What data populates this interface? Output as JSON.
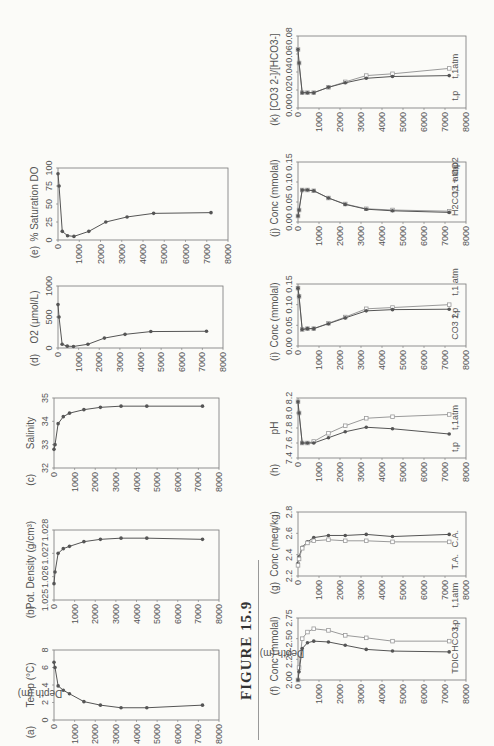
{
  "figure": {
    "label": "FIGURE 15.9",
    "y_axis_label": "Depth (m)"
  },
  "depth_ticks": [
    0,
    1000,
    2000,
    3000,
    4000,
    5000,
    6000,
    7000,
    8000
  ],
  "depths": [
    0,
    50,
    200,
    450,
    750,
    1450,
    2250,
    3250,
    4500,
    7200
  ],
  "chart_data": [
    {
      "id": "a",
      "type": "line",
      "title": "Temp (°C)",
      "xlabel": "Temp (°C)",
      "ylabel": "Depth (m)",
      "xlim": [
        0,
        8
      ],
      "xticks": [
        "0",
        "2",
        "4",
        "6",
        "8"
      ],
      "series": [
        {
          "name": "Temp",
          "y": [
            0,
            50,
            200,
            450,
            750,
            1450,
            2250,
            3250,
            4500,
            7200
          ],
          "x": [
            6.6,
            6.0,
            3.9,
            3.4,
            3.0,
            2.1,
            1.7,
            1.4,
            1.4,
            1.7
          ]
        }
      ]
    },
    {
      "id": "b",
      "type": "line",
      "title": "Pot. Density (g/cm³)",
      "xlabel": "(b) Pot. Density (g/cm3)",
      "ylabel": "Depth (m)",
      "xlim": [
        1.025,
        1.028
      ],
      "xticks": [
        "1.025",
        "1.026",
        "1.027",
        "1.028"
      ],
      "series": [
        {
          "name": "Potential density",
          "y": [
            0,
            50,
            200,
            450,
            750,
            1450,
            2250,
            3250,
            4500,
            7200
          ],
          "x": [
            1.0257,
            1.0262,
            1.027,
            1.0272,
            1.0273,
            1.0275,
            1.0276,
            1.02765,
            1.02765,
            1.0276
          ]
        }
      ]
    },
    {
      "id": "c",
      "type": "line",
      "title": "Salinity",
      "xlabel": "Salinity",
      "ylabel": "Depth (m)",
      "xlim": [
        32,
        35
      ],
      "xticks": [
        "32",
        "33",
        "34",
        "35"
      ],
      "series": [
        {
          "name": "Salinity",
          "y": [
            0,
            50,
            200,
            450,
            750,
            1450,
            2250,
            3250,
            4500,
            7200
          ],
          "x": [
            32.8,
            33.0,
            33.9,
            34.2,
            34.35,
            34.5,
            34.6,
            34.65,
            34.65,
            34.65
          ]
        }
      ]
    },
    {
      "id": "d",
      "type": "line",
      "title": "O2 (µmol/L)",
      "xlabel": "O2 (µmol/L)",
      "ylabel": "Depth (m)",
      "xlim": [
        0,
        1000
      ],
      "xticks": [
        "0",
        "500",
        "1000"
      ],
      "series": [
        {
          "name": "O2",
          "y": [
            0,
            50,
            200,
            450,
            750,
            1450,
            2250,
            3250,
            4500,
            7200
          ],
          "x": [
            700,
            500,
            60,
            30,
            25,
            60,
            160,
            220,
            265,
            270
          ]
        }
      ]
    },
    {
      "id": "e",
      "type": "line",
      "title": "% Saturation DO",
      "xlabel": "% Saturation DO",
      "ylabel": "Depth (m)",
      "xlim": [
        0,
        100
      ],
      "xticks": [
        "0",
        "25",
        "50",
        "75",
        "100"
      ],
      "series": [
        {
          "name": "% Saturation DO",
          "y": [
            0,
            50,
            200,
            450,
            750,
            1450,
            2250,
            3250,
            4500,
            7200
          ],
          "x": [
            92,
            75,
            12,
            6,
            5,
            12,
            25,
            32,
            37,
            38
          ]
        }
      ]
    },
    {
      "id": "f",
      "type": "line",
      "title": "Conc (mmolal)",
      "xlabel": "Conc (mmolal)",
      "ylabel": "Depth (m)",
      "xlim": [
        2.0,
        2.75
      ],
      "xticks": [
        "2.00",
        "2.25",
        "2.50",
        "2.75"
      ],
      "series": [
        {
          "name": "TDIC",
          "marker": "square",
          "y": [
            0,
            50,
            200,
            450,
            750,
            1450,
            2250,
            3250,
            4500,
            7200
          ],
          "x": [
            2.0,
            2.15,
            2.5,
            2.58,
            2.62,
            2.6,
            2.54,
            2.51,
            2.47,
            2.47
          ]
        },
        {
          "name": "HCO3-",
          "marker": "diamond",
          "y": [
            0,
            50,
            200,
            450,
            750,
            1450,
            2250,
            3250,
            4500,
            7200
          ],
          "x": [
            2.0,
            2.1,
            2.38,
            2.45,
            2.47,
            2.46,
            2.42,
            2.37,
            2.35,
            2.34
          ]
        }
      ],
      "annotations": [
        "TDIC",
        "HCO3-",
        "t,p",
        "t,1atm"
      ]
    },
    {
      "id": "g",
      "type": "line",
      "title": "Conc (meq/kg)",
      "xlabel": "Conc (meq/kg)",
      "ylabel": "Depth (m)",
      "xlim": [
        2.2,
        2.8
      ],
      "xticks": [
        "2.2",
        "2.4",
        "2.6",
        "2.8"
      ],
      "series": [
        {
          "name": "T.A.",
          "marker": "diamond",
          "y": [
            0,
            50,
            200,
            450,
            750,
            1450,
            2250,
            3250,
            4500,
            7200
          ],
          "x": [
            2.32,
            2.38,
            2.47,
            2.52,
            2.56,
            2.58,
            2.58,
            2.59,
            2.57,
            2.59
          ]
        },
        {
          "name": "C.A.",
          "marker": "square",
          "y": [
            0,
            50,
            200,
            450,
            750,
            1450,
            2250,
            3250,
            4500,
            7200
          ],
          "x": [
            2.3,
            2.36,
            2.46,
            2.51,
            2.53,
            2.54,
            2.53,
            2.53,
            2.52,
            2.52
          ]
        }
      ],
      "annotations": [
        "T.A.",
        "C.A."
      ]
    },
    {
      "id": "h",
      "type": "line",
      "title": "pH",
      "xlabel": "pH",
      "ylabel": "Depth (m)",
      "xlim": [
        7.4,
        8.2
      ],
      "xticks": [
        "7.4",
        "7.6",
        "7.8",
        "8.0",
        "8.2"
      ],
      "series": [
        {
          "name": "t,1atm",
          "marker": "square",
          "y": [
            0,
            50,
            200,
            450,
            750,
            1450,
            2250,
            3250,
            4500,
            7200
          ],
          "x": [
            8.15,
            8.0,
            7.6,
            7.6,
            7.62,
            7.73,
            7.83,
            7.93,
            7.95,
            7.98
          ]
        },
        {
          "name": "t,p",
          "marker": "diamond",
          "y": [
            0,
            50,
            200,
            450,
            750,
            1450,
            2250,
            3250,
            4500,
            7200
          ],
          "x": [
            8.15,
            8.0,
            7.6,
            7.6,
            7.6,
            7.67,
            7.75,
            7.81,
            7.79,
            7.72
          ]
        }
      ],
      "annotations": [
        "t,p",
        "t,1atm"
      ]
    },
    {
      "id": "i",
      "type": "line",
      "title": "Conc (mmolal)",
      "xlabel": "Conc (mmolal)",
      "ylabel": "Depth (m)",
      "xlim": [
        0,
        0.15
      ],
      "xticks": [
        "0.00",
        "0.05",
        "0.10",
        "0.15"
      ],
      "series": [
        {
          "name": "t,1 atm",
          "marker": "square",
          "y": [
            0,
            50,
            200,
            450,
            750,
            1450,
            2250,
            3250,
            4500,
            7200
          ],
          "x": [
            0.14,
            0.12,
            0.04,
            0.042,
            0.042,
            0.055,
            0.07,
            0.09,
            0.093,
            0.1
          ]
        },
        {
          "name": "t,p",
          "marker": "diamond",
          "y": [
            0,
            50,
            200,
            450,
            750,
            1450,
            2250,
            3250,
            4500,
            7200
          ],
          "x": [
            0.14,
            0.12,
            0.04,
            0.042,
            0.042,
            0.054,
            0.068,
            0.085,
            0.088,
            0.089
          ]
        }
      ],
      "annotations": [
        "CO3 2-",
        "t,p",
        "t,1 atm"
      ]
    },
    {
      "id": "j",
      "type": "line",
      "title": "Conc (mmolal)",
      "xlabel": "Conc (mmolal)",
      "ylabel": "Depth (m)",
      "xlim": [
        0,
        0.15
      ],
      "xticks": [
        "0.00",
        "0.05",
        "0.10",
        "0.15"
      ],
      "series": [
        {
          "name": "t,1 atm",
          "marker": "square",
          "y": [
            0,
            50,
            200,
            450,
            750,
            1450,
            2250,
            3250,
            4500,
            7200
          ],
          "x": [
            0.015,
            0.03,
            0.08,
            0.08,
            0.078,
            0.06,
            0.045,
            0.033,
            0.03,
            0.027
          ]
        },
        {
          "name": "t,p",
          "marker": "diamond",
          "y": [
            0,
            50,
            200,
            450,
            750,
            1450,
            2250,
            3250,
            4500,
            7200
          ],
          "x": [
            0.015,
            0.03,
            0.08,
            0.08,
            0.078,
            0.06,
            0.044,
            0.032,
            0.028,
            0.024
          ]
        }
      ],
      "annotations": [
        "H2CO3 + CO2",
        "t,1 atm",
        "t,p"
      ]
    },
    {
      "id": "k",
      "type": "line",
      "title": "[CO3 2-]/[HCO3-]",
      "xlabel": "[CO3 2-]/[HCO3-]",
      "ylabel": "Depth (m)",
      "xlim": [
        0,
        0.08
      ],
      "xticks": [
        "0.00",
        "0.02",
        "0.04",
        "0.06",
        "0.08"
      ],
      "series": [
        {
          "name": "t,1atm",
          "marker": "square",
          "y": [
            0,
            50,
            200,
            450,
            750,
            1450,
            2250,
            3250,
            4500,
            7200
          ],
          "x": [
            0.065,
            0.05,
            0.017,
            0.017,
            0.017,
            0.023,
            0.029,
            0.036,
            0.038,
            0.044
          ]
        },
        {
          "name": "t,p",
          "marker": "diamond",
          "y": [
            0,
            50,
            200,
            450,
            750,
            1450,
            2250,
            3250,
            4500,
            7200
          ],
          "x": [
            0.065,
            0.05,
            0.017,
            0.017,
            0.017,
            0.023,
            0.028,
            0.033,
            0.035,
            0.036
          ]
        }
      ],
      "annotations": [
        "t,p",
        "t,1atm"
      ]
    }
  ],
  "panels": [
    {
      "id": "a",
      "tag": "(a)",
      "label": "Temp (°C)",
      "sub": "",
      "x": 20,
      "y": 520,
      "show_depth_label": true
    },
    {
      "id": "b",
      "tag": "(b)",
      "label": "Pot. Density (g/cm",
      "sup": "3",
      "tail": ")",
      "x": 20,
      "y": 383
    },
    {
      "id": "c",
      "tag": "(c)",
      "label": "Salinity",
      "x": 20,
      "y": 262
    },
    {
      "id": "d",
      "tag": "(d)",
      "label": "O",
      "sub": "2",
      "tail": " (µmol/L)",
      "x": 20,
      "y": 140
    },
    {
      "id": "e",
      "tag": "(e)",
      "label": "% Saturation DO",
      "x": 20,
      "y": 18
    },
    {
      "id": "f",
      "tag": "(f)",
      "label": "Conc (mmolal)",
      "x": 258,
      "y": 520,
      "show_depth_label": true
    },
    {
      "id": "g",
      "tag": "(g)",
      "label": "Conc (meq/kg)",
      "x": 258,
      "y": 383
    },
    {
      "id": "h",
      "tag": "(h)",
      "label": "pH",
      "x": 258,
      "y": 262
    },
    {
      "id": "i",
      "tag": "(i)",
      "label": "Conc (mmolal)",
      "x": 258,
      "y": 140
    },
    {
      "id": "j",
      "tag": "(j)",
      "label": "Conc (mmolal)",
      "x": 258,
      "y": 18,
      "alt": true
    },
    {
      "id": "k",
      "tag": "(k)",
      "label": "[CO3-]/[HCO3 2-]",
      "x": 258,
      "y": -104
    }
  ]
}
